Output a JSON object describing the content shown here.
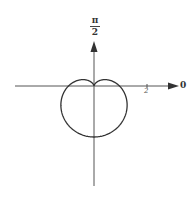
{
  "chart_data": {
    "type": "line",
    "subtype": "polar",
    "title": "",
    "equation": "r = 1 - sin(theta)",
    "axis_labels": {
      "polar_axis": "0",
      "vertical_axis_top": "π/2",
      "vertical_axis_numerator": "π",
      "vertical_axis_denominator": "2"
    },
    "tick_labels": [
      "2"
    ],
    "theta": [
      0,
      0.5236,
      1.0472,
      1.5708,
      2.0944,
      2.618,
      3.1416,
      3.6652,
      4.1888,
      4.7124,
      5.236,
      5.7596,
      6.2832
    ],
    "r": [
      1,
      0.5,
      0.134,
      0,
      0.134,
      0.5,
      1,
      1.5,
      1.866,
      2,
      1.866,
      1.5,
      1
    ],
    "r_range": [
      0,
      2
    ],
    "grid": false,
    "legend": null,
    "colors": {
      "curve": "#333333",
      "axes": "#555555"
    }
  }
}
